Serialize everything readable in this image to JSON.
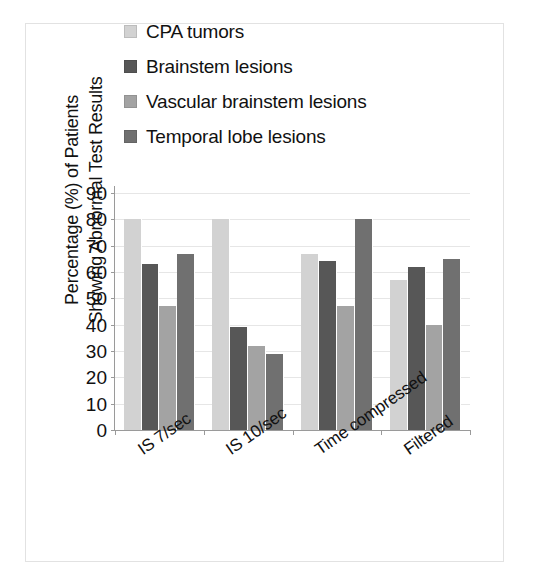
{
  "chart_data": {
    "type": "bar",
    "title": "",
    "xlabel": "",
    "ylabel_line1": "Percentage (%) of Patients",
    "ylabel_line2": "Showing Abnormal Test Results",
    "categories": [
      "IS 7/sec",
      "IS 10/sec",
      "Time compressed",
      "Filtered"
    ],
    "series": [
      {
        "name": "CPA tumors",
        "color": "#d2d2d2",
        "values": [
          80,
          80,
          67,
          57
        ]
      },
      {
        "name": "Brainstem lesions",
        "color": "#575757",
        "values": [
          63,
          39,
          64,
          62
        ]
      },
      {
        "name": "Vascular brainstem lesions",
        "color": "#a3a3a3",
        "values": [
          47,
          32,
          47,
          40
        ]
      },
      {
        "name": "Temporal lobe lesions",
        "color": "#707070",
        "values": [
          67,
          29,
          80,
          65
        ]
      }
    ],
    "ylim": [
      0,
      90
    ],
    "yticks": [
      0,
      10,
      20,
      30,
      40,
      50,
      60,
      70,
      80,
      90
    ],
    "ytick_labels": [
      "0",
      "10",
      "20",
      "30",
      "40",
      "50",
      "60",
      "70",
      "80",
      "90"
    ],
    "grid": true,
    "legend_position": "top-left",
    "bar_edge_color": "#ffffff",
    "axis_color": "#9a9a9a",
    "grid_color": "#e6e6e6",
    "frame_color": "#e2e2e2",
    "background": "#ffffff",
    "text_color": "#111111"
  },
  "legend": {
    "items": [
      {
        "label": "CPA tumors"
      },
      {
        "label": "Brainstem lesions"
      },
      {
        "label": "Vascular brainstem lesions"
      },
      {
        "label": "Temporal lobe lesions"
      }
    ]
  }
}
